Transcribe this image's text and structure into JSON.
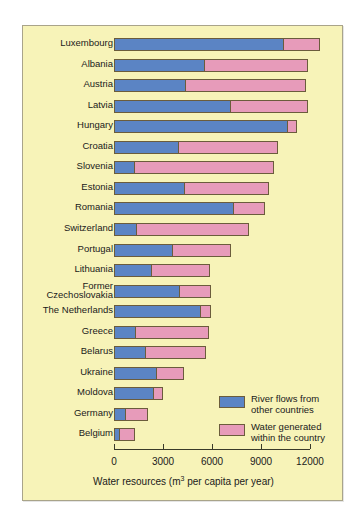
{
  "chart_data": {
    "type": "bar",
    "orientation": "horizontal",
    "stacked": true,
    "title": "",
    "xlabel_prefix": "Water resources (m",
    "xlabel_sup": "3",
    "xlabel_suffix": " per capita per year)",
    "xlabel_full": "Water resources (m3 per capita per year)",
    "ylabel": "",
    "xlim": [
      0,
      12600
    ],
    "axis_max_tick": 12000,
    "ticks": [
      0,
      3000,
      6000,
      9000,
      12000
    ],
    "tick_labels": [
      "0",
      "3000",
      "6000",
      "9000",
      "12000"
    ],
    "grid": false,
    "legend_position": "inside-bottom-right",
    "categories": [
      "Luxembourg",
      "Albania",
      "Austria",
      "Latvia",
      "Hungary",
      "Croatia",
      "Slovenia",
      "Estonia",
      "Romania",
      "Switzerland",
      "Portugal",
      "Lithuania",
      "Former Czechoslovakia",
      "The Netherlands",
      "Greece",
      "Belarus",
      "Ukraine",
      "Moldova",
      "Germany",
      "Belgium"
    ],
    "series": [
      {
        "name": "River flows from other countries",
        "color": "#5b84c4",
        "values": [
          10400,
          5600,
          4400,
          7150,
          10650,
          4000,
          1300,
          4370,
          7320,
          1420,
          3630,
          2340,
          4060,
          5350,
          1350,
          1970,
          2640,
          2460,
          740,
          370
        ]
      },
      {
        "name": "Water generated within the country",
        "color": "#e79bba",
        "values": [
          2200,
          6300,
          7350,
          4750,
          550,
          6030,
          8500,
          5110,
          1910,
          6830,
          3510,
          3510,
          1850,
          560,
          4440,
          3690,
          1660,
          560,
          1350,
          920
        ]
      }
    ],
    "totals": [
      12600,
      11900,
      11750,
      11900,
      11200,
      10030,
      9800,
      9480,
      9230,
      8250,
      7140,
      5850,
      5910,
      5910,
      5790,
      5660,
      4300,
      3020,
      2090,
      1290
    ]
  },
  "legend": {
    "items": [
      {
        "swatch": "blue",
        "line1": "River flows from",
        "line2": "other countries"
      },
      {
        "swatch": "pink",
        "line1": "Water generated",
        "line2": "within the country"
      }
    ]
  },
  "colors": {
    "background": "#f7f3b8",
    "river_flows": "#5b84c4",
    "water_generated": "#e79bba",
    "outline": "#6b5c3c",
    "axis": "#3a3a2a",
    "text": "#1a1a1a"
  }
}
